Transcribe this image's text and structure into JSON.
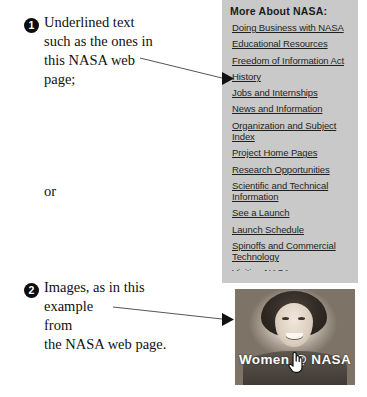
{
  "annotations": [
    {
      "marker": "1",
      "lines": [
        "Underlined text",
        "such as the ones in",
        "this NASA web",
        "page;"
      ]
    },
    {
      "marker": "2",
      "lines": [
        "Images, as in this",
        "example",
        "from",
        "the NASA web page."
      ]
    }
  ],
  "connector": "or",
  "nasa_panel": {
    "watermark": "National Aero",
    "title": "More About NASA:",
    "links": [
      "Doing Business with NASA",
      "Educational Resources",
      "Freedom of Information Act",
      "History",
      "Jobs and Internships",
      "News and Information",
      "Organization and Subject Index",
      "Project Home Pages",
      "Research Opportunities",
      "Scientific and Technical Information",
      "See a Launch",
      "Launch Schedule",
      "Spinoffs and Commercial Technology"
    ],
    "clipped_link": "Visiting NASA",
    "background_color": "#c9c9c9",
    "edge_color": "#a8a8a8"
  },
  "photo": {
    "caption": "Women @ NASA",
    "cursor": "hand-pointer"
  },
  "pointers": [
    {
      "label": "arrow-to-history",
      "target": "History"
    },
    {
      "label": "arrow-to-photo",
      "target": "Women @ NASA image"
    }
  ]
}
